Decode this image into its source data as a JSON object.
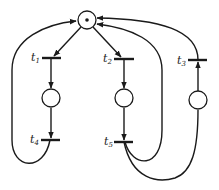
{
  "diagram": {
    "type": "petri-net",
    "places": [
      {
        "id": "p0",
        "tokens": 1
      },
      {
        "id": "p1",
        "tokens": 0
      },
      {
        "id": "p2",
        "tokens": 0
      },
      {
        "id": "p3",
        "tokens": 0
      }
    ],
    "transitions": [
      {
        "id": "t1",
        "label": "t",
        "sub": "1"
      },
      {
        "id": "t2",
        "label": "t",
        "sub": "2"
      },
      {
        "id": "t3",
        "label": "t",
        "sub": "3"
      },
      {
        "id": "t4",
        "label": "t",
        "sub": "4"
      },
      {
        "id": "t5",
        "label": "t",
        "sub": "5"
      }
    ],
    "arcs": [
      [
        "p0",
        "t1"
      ],
      [
        "t1",
        "p1"
      ],
      [
        "p1",
        "t4"
      ],
      [
        "t4",
        "p0"
      ],
      [
        "p0",
        "t2"
      ],
      [
        "t2",
        "p2"
      ],
      [
        "p2",
        "t5"
      ],
      [
        "t5",
        "p0"
      ],
      [
        "t5",
        "p3"
      ],
      [
        "p3",
        "t3"
      ],
      [
        "t3",
        "p0"
      ]
    ],
    "colors": {
      "stroke": "#1a1a1a",
      "background": "#ffffff"
    }
  }
}
